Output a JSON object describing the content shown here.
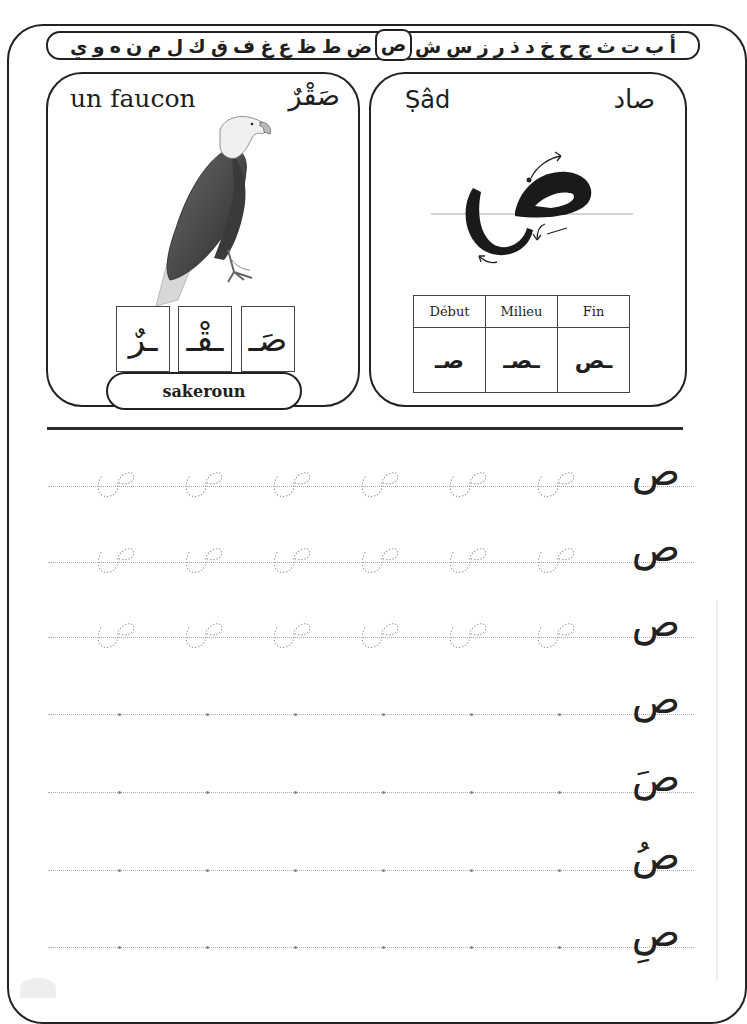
{
  "alphabet": {
    "letters": [
      "أ",
      "ب",
      "ت",
      "ث",
      "ج",
      "ح",
      "خ",
      "د",
      "ذ",
      "ر",
      "ز",
      "س",
      "ش",
      "ص",
      "ض",
      "ط",
      "ظ",
      "ع",
      "غ",
      "ف",
      "ق",
      "ك",
      "ل",
      "م",
      "ن",
      "ه",
      "و",
      "ي"
    ],
    "active_letter": "ص"
  },
  "word_card": {
    "french": "un faucon",
    "arabic": "صَقْرٌ",
    "image": "eagle-illustration",
    "syllables": [
      "صَـ",
      "ـقْـ",
      "ـرٌ"
    ],
    "transliteration": "sakeroun"
  },
  "letter_card": {
    "name_latin": "Ṣâd",
    "name_arabic": "صاد",
    "big_letter": "ص",
    "forms_headers": [
      "Début",
      "Milieu",
      "Fin"
    ],
    "forms": [
      "صـ",
      "ـصـ",
      "ـص"
    ]
  },
  "practice": {
    "rows": [
      {
        "model": "ص",
        "traced": true
      },
      {
        "model": "ص",
        "traced": true
      },
      {
        "model": "ص",
        "traced": true
      },
      {
        "model": "ص",
        "traced": false
      },
      {
        "model": "صَ",
        "traced": false
      },
      {
        "model": "صُ",
        "traced": false
      },
      {
        "model": "صِ",
        "traced": false
      }
    ]
  }
}
